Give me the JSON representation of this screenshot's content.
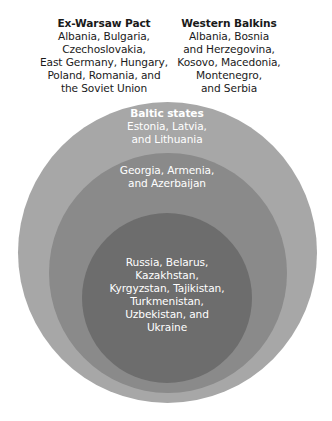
{
  "colors": {
    "outer_circle": "#a7a7a7",
    "middle_circle": "#8a8a8a",
    "inner_circle": "#6d6d6d",
    "outside_text": "#1a1a1a",
    "inside_text": "#ffffff",
    "background": "#ffffff"
  },
  "outside_labels": {
    "ex_warsaw_pact": {
      "title": "Ex-Warsaw Pact",
      "lines": [
        "Albania, Bulgaria,",
        "Czechoslovakia,",
        "East Germany, Hungary,",
        "Poland, Romania, and",
        "the Soviet Union"
      ]
    },
    "western_balkans": {
      "title": "Western Balkins",
      "lines": [
        "Albania, Bosnia",
        "and Herzegovina,",
        "Kosovo, Macedonia,",
        "Montenegro,",
        "and Serbia"
      ]
    }
  },
  "circles": {
    "outer": {
      "title": "Baltic states",
      "lines": [
        "Estonia, Latvia,",
        "and Lithuania"
      ]
    },
    "middle": {
      "lines": [
        "Georgia, Armenia,",
        "and Azerbaijan"
      ]
    },
    "inner": {
      "lines": [
        "Russia, Belarus,",
        "Kazakhstan,",
        "Kyrgyzstan, Tajikistan,",
        "Turkmenistan,",
        "Uzbekistan, and",
        "Ukraine"
      ]
    }
  }
}
